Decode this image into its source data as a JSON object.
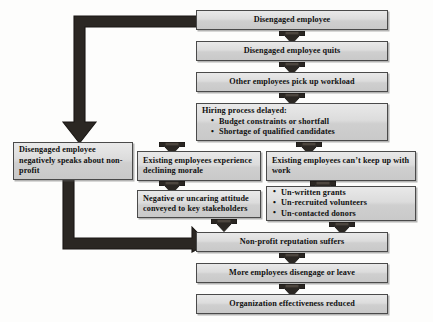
{
  "diagram": {
    "colors": {
      "box_fill": "#dcdcdc",
      "box_border": "#4a4a4a",
      "arrow": "#2b2723",
      "text": "#101010",
      "background": "#fdfdfc"
    },
    "nodes": [
      {
        "id": "disengaged-employee",
        "label": "Disengaged employee",
        "align": "center"
      },
      {
        "id": "disengaged-employee-quits",
        "label": "Disengaged employee quits",
        "align": "center"
      },
      {
        "id": "other-employees-pick-up-workload",
        "label": "Other employees pick up workload",
        "align": "center"
      },
      {
        "id": "hiring-process-delayed",
        "heading": "Hiring process delayed:",
        "bullets": [
          "Budget constraints or shortfall",
          "Shortage of qualified candidates"
        ],
        "align": "left"
      },
      {
        "id": "disengaged-employee-negatively-speaks",
        "label": "Disengaged employee negatively speaks about non-profit",
        "align": "left"
      },
      {
        "id": "existing-employees-declining-morale",
        "label": "Existing employees experience declining morale",
        "align": "left"
      },
      {
        "id": "existing-employees-cant-keep-up",
        "label": "Existing employees can’t keep up with work",
        "align": "left"
      },
      {
        "id": "negative-or-uncaring-attitude",
        "label": "Negative or uncaring attitude conveyed to key stakeholders",
        "align": "left"
      },
      {
        "id": "unmet-needs",
        "bullets": [
          "Un-written grants",
          "Un-recruited volunteers",
          "Un-contacted donors"
        ],
        "align": "left"
      },
      {
        "id": "non-profit-reputation-suffers",
        "label": "Non-profit reputation suffers",
        "align": "center"
      },
      {
        "id": "more-employees-disengage-or-leave",
        "label": "More employees disengage or leave",
        "align": "center"
      },
      {
        "id": "organization-effectiveness-reduced",
        "label": "Organization effectiveness reduced",
        "align": "center"
      }
    ],
    "connectors": [
      {
        "id": "arrow-employee-to-quits",
        "kind": "down-arrow"
      },
      {
        "id": "arrow-quits-to-workload",
        "kind": "down-arrow"
      },
      {
        "id": "arrow-workload-to-hiring",
        "kind": "down-arrow"
      },
      {
        "id": "arrow-hiring-to-morale",
        "kind": "down-arrow"
      },
      {
        "id": "arrow-hiring-to-keep-up",
        "kind": "down-arrow"
      },
      {
        "id": "arrow-morale-to-attitude",
        "kind": "down-arrow"
      },
      {
        "id": "arrow-keep-up-to-unmet",
        "kind": "down-arrow"
      },
      {
        "id": "arrow-attitude-to-reputation",
        "kind": "down-arrow"
      },
      {
        "id": "arrow-unmet-to-reputation",
        "kind": "down-arrow"
      },
      {
        "id": "arrow-reputation-to-more-disengage",
        "kind": "down-arrow"
      },
      {
        "id": "arrow-more-disengage-to-effectiveness",
        "kind": "down-arrow"
      },
      {
        "id": "elbow-employee-to-negatively-speaks",
        "kind": "elbow-left-down"
      },
      {
        "id": "elbow-negatively-speaks-to-reputation",
        "kind": "elbow-down-right"
      }
    ]
  }
}
